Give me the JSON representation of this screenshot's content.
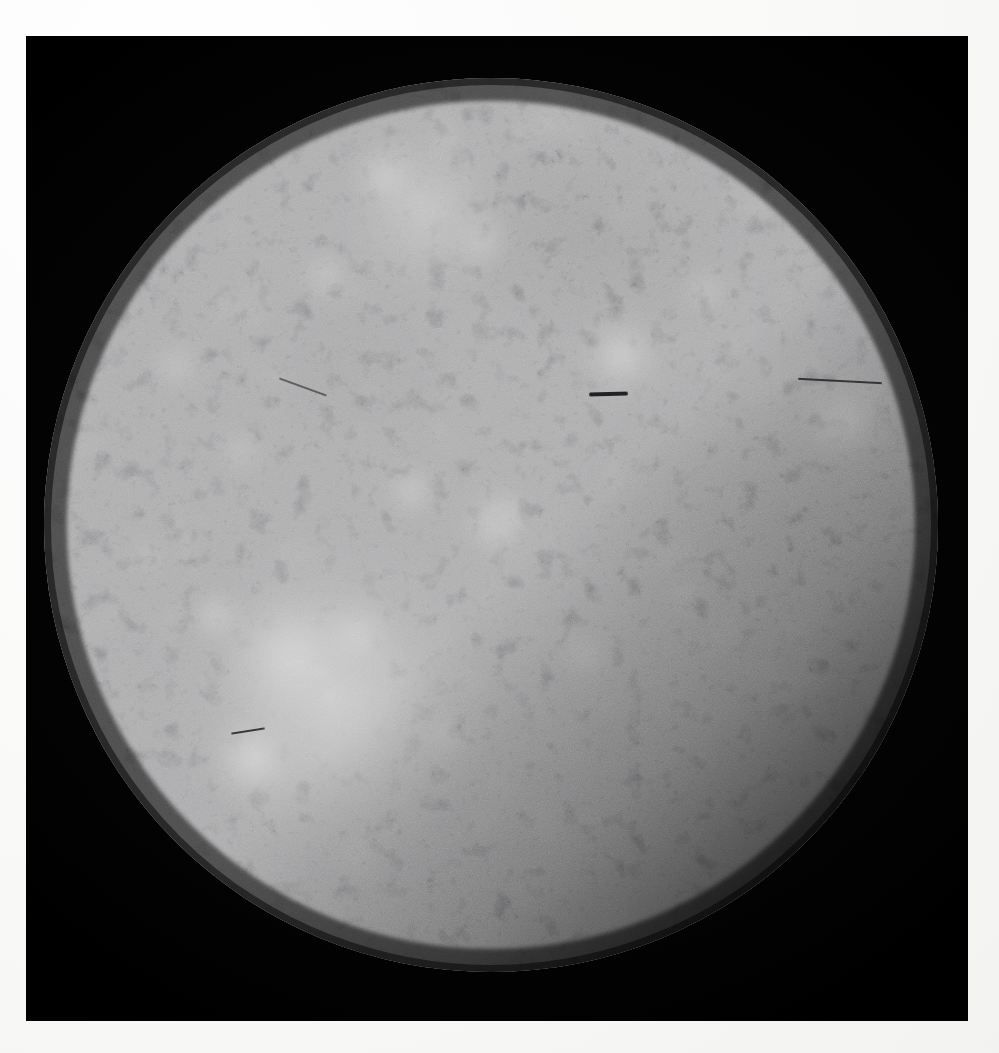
{
  "document": {
    "kind": "photographic-plate",
    "medium": "black-and-white print on white paper",
    "subject": "Callisto",
    "subject_class": "Jovian satellite / icy moon",
    "caption": ""
  },
  "canvas": {
    "width": 999,
    "height": 1053,
    "paper_color": "#fbfbfa",
    "photo_rect": {
      "x": 26,
      "y": 36,
      "width": 942,
      "height": 985
    },
    "photo_background_color": "#000000"
  },
  "image_content": {
    "primary_object": "cratered-sphere",
    "object_label": "Callisto disk",
    "disk": {
      "center_x": 465,
      "center_y": 489,
      "radius": 447,
      "limb_sharpness": "soft",
      "illumination": "full disk, sun from upper-left",
      "terminator_quadrant": "lower-right",
      "base_color": "#6e6e6e",
      "highlight_color": "#f2f2f2",
      "shadow_color": "#101010"
    },
    "surface_description": "Densely and uniformly cratered ice crust saturated with bright-rayed impact craters.",
    "features": [
      {
        "name": "Valhalla multi-ring basin",
        "type": "bright-impact-basin",
        "cx": 305,
        "cy": 660,
        "radius": 150,
        "brightness": 0.96
      },
      {
        "name": "Asgard bright ring",
        "type": "bright-crater-cluster",
        "cx": 400,
        "cy": 175,
        "radius": 95,
        "brightness": 0.84
      },
      {
        "name": "Bright rayed crater, north-central",
        "type": "rayed-crater",
        "cx": 595,
        "cy": 320,
        "radius": 46,
        "brightness": 0.88
      },
      {
        "name": "Bright rayed crater, east limb",
        "type": "rayed-crater",
        "cx": 820,
        "cy": 385,
        "radius": 44,
        "brightness": 0.8
      },
      {
        "name": "Dark cratered plains, north-central",
        "type": "dark-terrain",
        "cx": 560,
        "cy": 200,
        "radius": 120,
        "brightness": 0.28
      },
      {
        "name": "Shadowed southeastern limb",
        "type": "terminator-shadow",
        "cx": 760,
        "cy": 790,
        "radius": 210,
        "brightness": 0.06
      }
    ],
    "defects": [
      {
        "name": "center-streak",
        "type": "emulsion-scratch",
        "x": 563,
        "y": 356,
        "length": 39
      },
      {
        "name": "right-hairline",
        "type": "emulsion-scratch",
        "x": 772,
        "y": 344,
        "length": 84
      },
      {
        "name": "valhalla-hairline",
        "type": "emulsion-scratch",
        "x": 205,
        "y": 694,
        "length": 34
      },
      {
        "name": "left-hairline",
        "type": "emulsion-scratch",
        "x": 252,
        "y": 350,
        "length": 50
      }
    ],
    "tone": {
      "range": "full black to near-white",
      "grain": "visible film grain",
      "scan_artifacts": "faint horizontal raster lines"
    }
  }
}
